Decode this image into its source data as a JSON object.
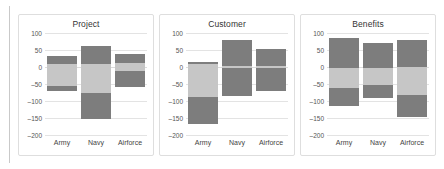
{
  "figure": {
    "background": "#ffffff",
    "panel_border": "#dedede",
    "grid_color": "#e3e3e3"
  },
  "palette": {
    "dark": "#7d7d7d",
    "light": "#c6c6c6",
    "axis_text": "#555555",
    "title_text": "#333333"
  },
  "axis": {
    "ylim": [
      -200,
      100
    ],
    "yticks": [
      100,
      50,
      0,
      -50,
      -100,
      -150,
      -200
    ],
    "ytick_labels": [
      "100",
      "50",
      "0",
      "–50",
      "–100",
      "–150",
      "–200"
    ],
    "categories": [
      "Army",
      "Navy",
      "Airforce"
    ],
    "grid": true,
    "legend": "none"
  },
  "chart_data": [
    {
      "type": "bar",
      "title": "Project",
      "xlabel": "",
      "ylabel": "",
      "ylim": [
        -200,
        100
      ],
      "yticks": [
        100,
        50,
        0,
        -50,
        -100,
        -150,
        -200
      ],
      "categories": [
        "Army",
        "Navy",
        "Airforce"
      ],
      "series": [
        {
          "name": "upper-dark",
          "color": "#7d7d7d",
          "from": [
            32,
            62,
            38
          ],
          "to": [
            8,
            8,
            12
          ]
        },
        {
          "name": "mid-light",
          "color": "#c6c6c6",
          "from": [
            8,
            8,
            12
          ],
          "to": [
            -56,
            -76,
            -12
          ]
        },
        {
          "name": "lower-dark",
          "color": "#7d7d7d",
          "from": [
            -56,
            -76,
            -12
          ],
          "to": [
            -70,
            -154,
            -58
          ]
        }
      ],
      "box_top": [
        32,
        62,
        38
      ],
      "box_bottom": [
        -70,
        -154,
        -58
      ]
    },
    {
      "type": "bar",
      "title": "Customer",
      "xlabel": "",
      "ylabel": "",
      "ylim": [
        -200,
        100
      ],
      "yticks": [
        100,
        50,
        0,
        -50,
        -100,
        -150,
        -200
      ],
      "categories": [
        "Army",
        "Navy",
        "Airforce"
      ],
      "series": [
        {
          "name": "upper-dark",
          "color": "#7d7d7d",
          "from": [
            15,
            80,
            52
          ],
          "to": [
            9,
            3,
            3
          ]
        },
        {
          "name": "mid-light",
          "color": "#c6c6c6",
          "from": [
            9,
            3,
            3
          ],
          "to": [
            -88,
            -3,
            -3
          ]
        },
        {
          "name": "lower-dark",
          "color": "#7d7d7d",
          "from": [
            -88,
            -3,
            -3
          ],
          "to": [
            -168,
            -85,
            -72
          ]
        }
      ],
      "box_top": [
        15,
        80,
        52
      ],
      "box_bottom": [
        -168,
        -85,
        -72
      ]
    },
    {
      "type": "bar",
      "title": "Benefits",
      "xlabel": "",
      "ylabel": "",
      "ylim": [
        -200,
        100
      ],
      "yticks": [
        100,
        50,
        0,
        -50,
        -100,
        -150,
        -200
      ],
      "categories": [
        "Army",
        "Navy",
        "Airforce"
      ],
      "series": [
        {
          "name": "upper-dark",
          "color": "#7d7d7d",
          "from": [
            85,
            70,
            80
          ],
          "to": [
            -2,
            -2,
            0
          ]
        },
        {
          "name": "mid-light",
          "color": "#c6c6c6",
          "from": [
            -2,
            -2,
            0
          ],
          "to": [
            -62,
            -52,
            -82
          ]
        },
        {
          "name": "lower-dark",
          "color": "#7d7d7d",
          "from": [
            -62,
            -52,
            -82
          ],
          "to": [
            -115,
            -92,
            -148
          ]
        }
      ],
      "box_top": [
        85,
        70,
        80
      ],
      "box_bottom": [
        -115,
        -92,
        -148
      ]
    }
  ]
}
